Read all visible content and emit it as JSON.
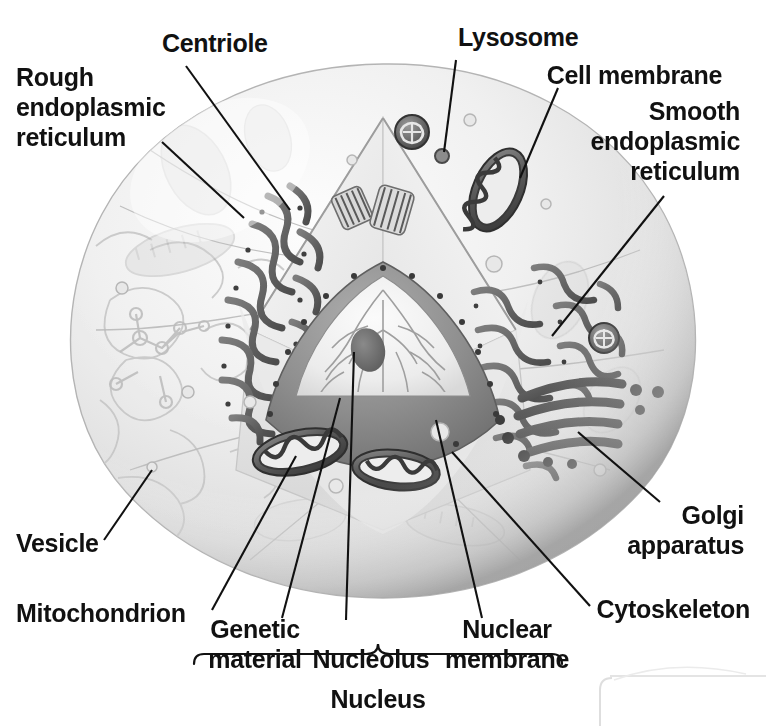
{
  "diagram": {
    "style": "grayscale textbook illustration",
    "colors": {
      "text": "#111111",
      "leader_line": "#111111",
      "cell_light": "#f2f2f2",
      "cell_mid": "#d8d8d8",
      "cell_dark": "#9a9a9a",
      "organelle_dark": "#4a4a4a",
      "background": "#ffffff"
    },
    "labels": [
      {
        "id": "centriole",
        "text": "Centriole",
        "align": "left"
      },
      {
        "id": "rough_er",
        "text": "Rough\nendoplasmic\nreticulum",
        "align": "left"
      },
      {
        "id": "lysosome",
        "text": "Lysosome",
        "align": "left"
      },
      {
        "id": "cell_membrane",
        "text": "Cell membrane",
        "align": "right"
      },
      {
        "id": "smooth_er",
        "text": "Smooth\nendoplasmic\nreticulum",
        "align": "right"
      },
      {
        "id": "golgi",
        "text": "Golgi\napparatus",
        "align": "right"
      },
      {
        "id": "cytoskeleton",
        "text": "Cytoskeleton",
        "align": "left"
      },
      {
        "id": "vesicle",
        "text": "Vesicle",
        "align": "left"
      },
      {
        "id": "mitochondrion",
        "text": "Mitochondrion",
        "align": "left"
      },
      {
        "id": "genetic_material",
        "text": "Genetic\nmaterial",
        "align": "center"
      },
      {
        "id": "nucleolus",
        "text": "Nucleolus",
        "align": "center"
      },
      {
        "id": "nuclear_membrane",
        "text": "Nuclear\nmembrane",
        "align": "center"
      },
      {
        "id": "nucleus",
        "text": "Nucleus",
        "align": "center"
      }
    ],
    "bracket": {
      "groups_label": "Nucleus",
      "members": [
        "Genetic material",
        "Nucleolus",
        "Nuclear membrane"
      ]
    }
  }
}
